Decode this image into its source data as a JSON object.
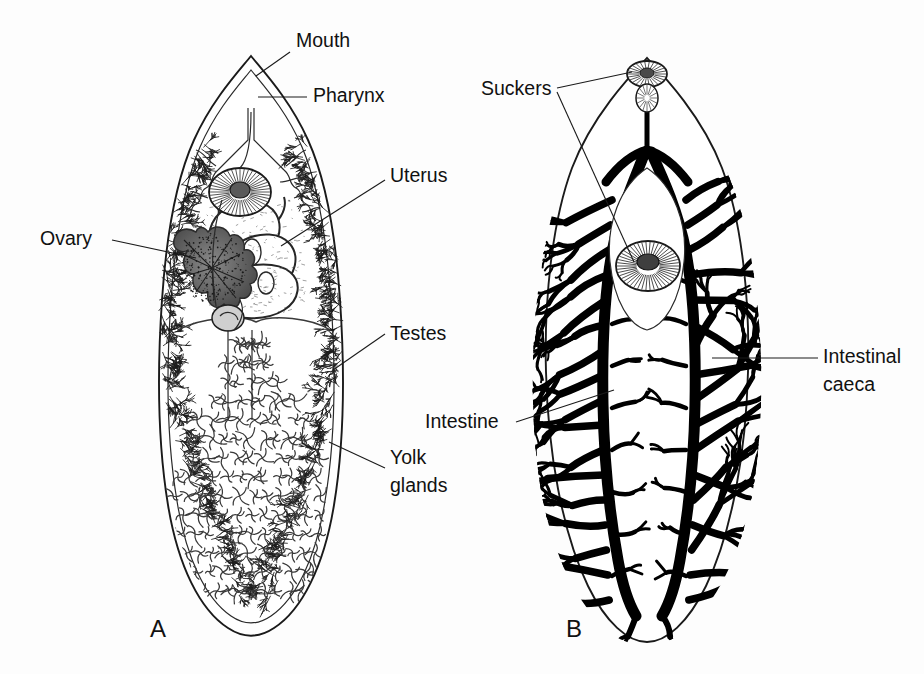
{
  "figure": {
    "background_color": "#fdfdfd",
    "ink_color": "#1a1a1a",
    "panels": [
      {
        "letter": "A",
        "letter_x": 150,
        "letter_y": 637,
        "subject": "reproductive-and-digestive-anatomy",
        "labels": [
          {
            "id": "mouth",
            "text": "Mouth",
            "x": 296,
            "y": 47,
            "anchor": "start"
          },
          {
            "id": "pharynx",
            "text": "Pharynx",
            "x": 313,
            "y": 102,
            "anchor": "start"
          },
          {
            "id": "uterus",
            "text": "Uterus",
            "x": 390,
            "y": 182,
            "anchor": "start"
          },
          {
            "id": "ovary",
            "text": "Ovary",
            "x": 40,
            "y": 245,
            "anchor": "start"
          },
          {
            "id": "testes",
            "text": "Testes",
            "x": 390,
            "y": 340,
            "anchor": "start"
          },
          {
            "id": "yolk-glands-line1",
            "text": "Yolk",
            "x": 390,
            "y": 464,
            "anchor": "start"
          },
          {
            "id": "yolk-glands-line2",
            "text": "glands",
            "x": 390,
            "y": 492,
            "anchor": "start"
          }
        ]
      },
      {
        "letter": "B",
        "letter_x": 566,
        "letter_y": 637,
        "subject": "digestive-system-intestinal-caeca",
        "labels": [
          {
            "id": "suckers",
            "text": "Suckers",
            "x": 481,
            "y": 95,
            "anchor": "start"
          },
          {
            "id": "intestine",
            "text": "Intestine",
            "x": 425,
            "y": 428,
            "anchor": "start"
          },
          {
            "id": "intestinal-caeca-line1",
            "text": "Intestinal",
            "x": 823,
            "y": 363,
            "anchor": "start"
          },
          {
            "id": "intestinal-caeca-line2",
            "text": "caeca",
            "x": 823,
            "y": 391,
            "anchor": "start"
          }
        ]
      }
    ]
  }
}
